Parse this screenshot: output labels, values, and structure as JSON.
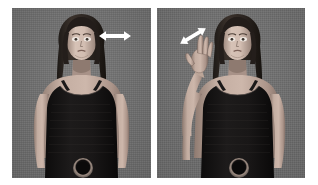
{
  "figure": {
    "background_color": "#ffffff",
    "panel_background_color": "#6f6f6f",
    "arrow_color": "#ffffff",
    "panel_count": 2
  },
  "panels": [
    {
      "id": "panel-left",
      "label": "left-panel",
      "x": 12,
      "y": 8,
      "width": 139,
      "height": 170,
      "avatar": {
        "description": "female virtual human avatar, frontal view, long dark hair, black camisole with thin shoulder straps, arms resting at sides, circular belt buckle at waist",
        "pose": "arms-at-sides",
        "skin_color": "#b9a398",
        "hair_color": "#2a2320",
        "top_color": "#151313",
        "belt_buckle_color": "#1a1717"
      },
      "gesture_arrow": {
        "name": "horizontal-double-arrow",
        "direction": "horizontal",
        "style": "double-headed",
        "angle_deg": 0,
        "x": 98,
        "y": 29,
        "width": 34,
        "height": 14
      }
    },
    {
      "id": "panel-right",
      "label": "right-panel",
      "x": 157,
      "y": 8,
      "width": 148,
      "height": 170,
      "avatar": {
        "description": "same female virtual human avatar, frontal view, left arm raised with open hand near shoulder/face height performing a gesture, long dark hair, black camisole, circular belt buckle at waist",
        "pose": "left-arm-raised-hand-gesture",
        "skin_color": "#b9a398",
        "hair_color": "#2a2320",
        "top_color": "#151313",
        "belt_buckle_color": "#1a1717"
      },
      "gesture_arrow": {
        "name": "diagonal-double-arrow",
        "direction": "diagonal-up-right",
        "style": "double-headed",
        "angle_deg": -30,
        "x": 177,
        "y": 25,
        "width": 32,
        "height": 22
      }
    }
  ]
}
